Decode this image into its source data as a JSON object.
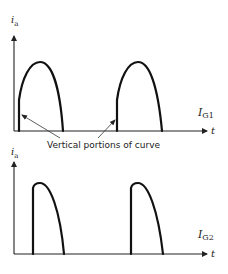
{
  "diagram": {
    "top_graph": {
      "y_axis_label": "i",
      "y_axis_label_sub": "a",
      "x_axis_label": "t",
      "trace_label": "I",
      "trace_label_sub": "G1",
      "description": "Anode current pulses with vertical rise at turn-on (early firing)"
    },
    "annotation": {
      "text": "Vertical portions of curve"
    },
    "bottom_graph": {
      "y_axis_label": "i",
      "y_axis_label_sub": "a",
      "x_axis_label": "t",
      "trace_label": "I",
      "trace_label_sub": "G2",
      "description": "Anode current pulses with larger vertical rise (later firing)"
    },
    "colors": {
      "stroke": "#111111",
      "background": "#ffffff"
    }
  }
}
